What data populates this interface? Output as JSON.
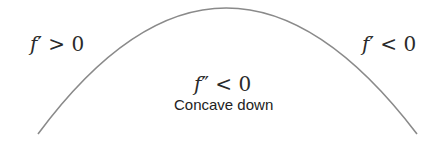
{
  "diagram": {
    "curve": {
      "shape": "downward parabola",
      "stroke_color": "#8a8a8a",
      "start": [
        38,
        134
      ],
      "peak": [
        225,
        8
      ],
      "end": [
        417,
        134
      ]
    },
    "labels": {
      "left": {
        "func": "f",
        "prime": "′",
        "relation": ">",
        "value": "0"
      },
      "right": {
        "func": "f",
        "prime": "′",
        "relation": "<",
        "value": "0"
      },
      "center": {
        "func": "f",
        "prime": "″",
        "relation": "<",
        "value": "0"
      },
      "caption": "Concave down"
    }
  }
}
